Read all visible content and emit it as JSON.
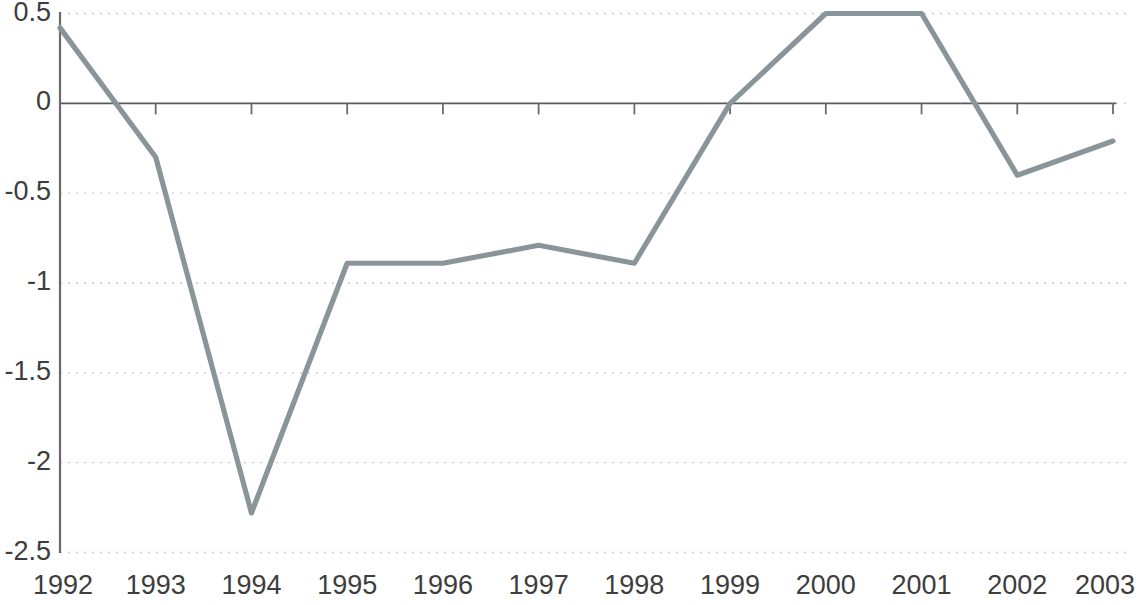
{
  "chart_data": {
    "type": "line",
    "title": "",
    "subtitle": "",
    "xlabel": "",
    "ylabel": "",
    "categories": [
      "1992",
      "1993",
      "1994",
      "1995",
      "1996",
      "1997",
      "1998",
      "1999",
      "2000",
      "2001",
      "2002",
      "2003"
    ],
    "x": [
      1992,
      1993,
      1994,
      1995,
      1996,
      1997,
      1998,
      1999,
      2000,
      2001,
      2002,
      2003
    ],
    "values": [
      0.42,
      -0.3,
      -2.28,
      -0.89,
      -0.89,
      -0.79,
      -0.89,
      0,
      0.5,
      0.5,
      -0.4,
      -0.21
    ],
    "series": [
      {
        "name": "",
        "values": [
          0.42,
          -0.3,
          -2.28,
          -0.89,
          -0.89,
          -0.79,
          -0.89,
          0,
          0.5,
          0.5,
          -0.4,
          -0.21
        ]
      }
    ],
    "ylim": [
      -2.5,
      0.5
    ],
    "xlim": [
      1992,
      2003
    ],
    "yticks": [
      0.5,
      0,
      -0.5,
      -1,
      -1.5,
      -2,
      -2.5
    ],
    "ytick_labels": [
      "0.5",
      "0",
      "-0.5",
      "-1",
      "-1.5",
      "-2",
      "-2.5"
    ],
    "xtick_labels": [
      "1992",
      "1993",
      "1994",
      "1995",
      "1996",
      "1997",
      "1998",
      "1999",
      "2000",
      "2001",
      "2002",
      "2003"
    ],
    "grid": true,
    "grid_axis": "y",
    "grid_style": "dotted",
    "legend": false,
    "legend_position": "none",
    "annotations": [],
    "colors": {
      "line": "#8a9599",
      "grid": "#c9c9c9",
      "axis": "#6b6b6b",
      "zero_axis": "#5a5a5a",
      "tick_text": "#3d3d3d",
      "background": "#ffffff"
    }
  }
}
